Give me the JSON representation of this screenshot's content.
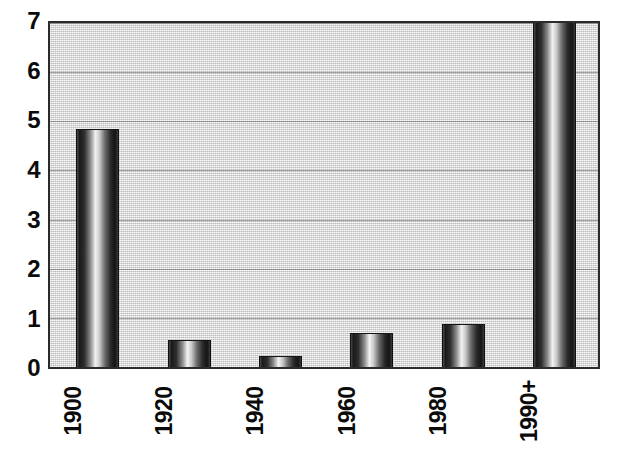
{
  "chart_data": {
    "type": "bar",
    "title": "",
    "subtitle": "",
    "xlabel": "",
    "ylabel": "",
    "categories": [
      "1900",
      "1920",
      "1940",
      "1960",
      "1980",
      "1990+"
    ],
    "values": [
      4.85,
      0.55,
      0.22,
      0.7,
      0.88,
      7.2
    ],
    "value_notes": [
      "bar reaches just below the 5 gridline",
      "bar reaches about half of the first unit",
      "shortest bar, about one fifth of a unit",
      "bar reaches about 0.7",
      "bar reaches nearly 0.9",
      "bar is clipped at the top of the plot; exceeds the 7 axis maximum"
    ],
    "ylim": [
      0,
      7
    ],
    "y_ticks": [
      0,
      1,
      2,
      3,
      4,
      5,
      6,
      7
    ],
    "y_tick_labels": [
      "0",
      "1",
      "2",
      "3",
      "4",
      "5",
      "6",
      "7"
    ],
    "grid": true,
    "grid_orientation": "horizontal",
    "legend": false,
    "legend_position": "none",
    "x_tick_rotation": 90,
    "bar_style": "cylindrical-gradient-grayscale",
    "colors": {
      "plot_background": "#dcdcdc",
      "gridline": "#606060",
      "axis_border": "#2b2b2b",
      "bar_dark": "#141414",
      "bar_highlight": "#f2f2f2",
      "text": "#0b0b0b",
      "page_background": "#ffffff"
    }
  }
}
